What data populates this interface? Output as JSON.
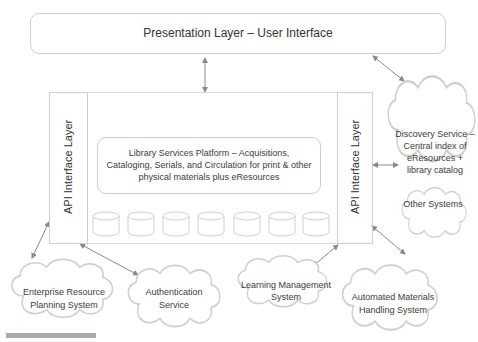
{
  "presentation_layer": {
    "label": "Presentation Layer – User Interface"
  },
  "api_left": {
    "label": "API Interface Layer"
  },
  "api_right": {
    "label": "API Interface Layer"
  },
  "platform": {
    "label": "Library Services Platform – Acquisitions, Cataloging, Serials, and Circulation for print & other physical materials plus eResources",
    "databases": 7
  },
  "clouds": {
    "discovery": "Discovery Service – Central index of eResources + library catalog",
    "other": "Other Systems",
    "erp": "Enterprise Resource Planning System",
    "auth": "Authentication Service",
    "lms": "Learning Management System",
    "amh": "Automated Materials Handling System"
  },
  "colors": {
    "line": "#cfcfcf",
    "arrow": "#8a8a8a",
    "text": "#3c3c3c"
  }
}
